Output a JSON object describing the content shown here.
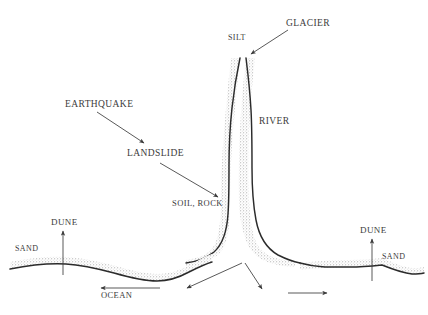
{
  "figure": {
    "kind": "hand-drawn-geological-diagram",
    "ink_color": "#2b2b2b",
    "text_color": "#3b3b3b",
    "stipple_color": "#9a9a9a",
    "background_color": "#ffffff"
  },
  "labels": {
    "glacier": "GLACIER",
    "silt": "SILT",
    "river": "RIVER",
    "earthquake": "EARTHQUAKE",
    "landslide": "LANDSLIDE",
    "soil_rock": "SOIL, ROCK",
    "dune_left": "DUNE",
    "dune_right": "DUNE",
    "sand_left": "SAND",
    "sand_right": "SAND",
    "ocean": "OCEAN"
  },
  "annotations": [
    {
      "name": "glacier-arrow",
      "from_label": "GLACIER",
      "points_to": "river valley head",
      "direction": "down-left"
    },
    {
      "name": "earthquake-arrow",
      "from_label": "EARTHQUAKE",
      "points_to": "LANDSLIDE",
      "direction": "down-right"
    },
    {
      "name": "landslide-arrow",
      "from_label": "LANDSLIDE",
      "points_to": "river left bank",
      "direction": "down-right"
    },
    {
      "name": "dune-left-arrow",
      "from_label": "DUNE",
      "points_to": "left shoreline crest",
      "direction": "up"
    },
    {
      "name": "dune-right-arrow",
      "from_label": "DUNE",
      "points_to": "right shoreline crest",
      "direction": "up"
    },
    {
      "name": "ocean-arrow",
      "from_label": "OCEAN",
      "points_to": "offshore left",
      "direction": "left"
    },
    {
      "name": "delta-arrow-left",
      "from_label": "",
      "points_to": "offshore left of mouth",
      "direction": "down-left"
    },
    {
      "name": "delta-arrow-right",
      "from_label": "",
      "points_to": "offshore right of mouth",
      "direction": "down-right"
    },
    {
      "name": "longshore-arrow",
      "from_label": "",
      "points_to": "offshore right",
      "direction": "right"
    }
  ]
}
